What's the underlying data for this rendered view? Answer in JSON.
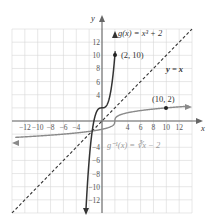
{
  "chart_data": {
    "type": "line",
    "title": "",
    "xlabel": "x",
    "ylabel": "y",
    "xlim": [
      -14,
      14
    ],
    "ylim": [
      -14,
      14
    ],
    "grid": true,
    "x_ticks": [
      -12,
      -10,
      -8,
      -6,
      -4,
      4,
      6,
      8,
      10,
      12
    ],
    "y_ticks": [
      12,
      10,
      8,
      6,
      4,
      -4,
      -6,
      -8,
      -10,
      -12
    ],
    "series": [
      {
        "name": "g(x) = x³ + 2",
        "function": "x^3 + 2",
        "color": "#333333",
        "style": "solid"
      },
      {
        "name": "g⁻¹(x) = ∛(x − 2)",
        "function": "cbrt(x - 2)",
        "color": "#888888",
        "style": "solid"
      },
      {
        "name": "y = x",
        "function": "x",
        "color": "#333333",
        "style": "dashed"
      }
    ],
    "annotations": [
      {
        "label": "(2, 10)",
        "x": 2,
        "y": 10
      },
      {
        "label": "(10, 2)",
        "x": 10,
        "y": 2
      }
    ]
  },
  "labels": {
    "x_axis": "x",
    "y_axis": "y",
    "g": "g(x) = x³ + 2",
    "g_inv": "g⁻¹(x) = ∛x − 2",
    "identity": "y = x",
    "p1": "(2, 10)",
    "p2": "(10, 2)"
  },
  "ticks": {
    "xneg": [
      "−12",
      "−10",
      "−8",
      "−6",
      "−4"
    ],
    "xpos": [
      "4",
      "6",
      "8",
      "10",
      "12"
    ],
    "ypos": [
      "12",
      "10",
      "8",
      "6",
      "4"
    ],
    "yneg": [
      "−4",
      "−6",
      "−8",
      "−10",
      "−12"
    ]
  }
}
